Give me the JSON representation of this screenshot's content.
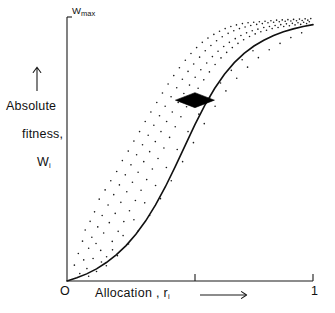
{
  "figure": {
    "background": "#ffffff",
    "ink_color": "#1a1a1a",
    "curve_color": "#111111",
    "marker_color": "#000000"
  },
  "axes": {
    "y_top_label_base": "W",
    "y_top_label_sub": "max",
    "y_axis_title_line1": "Absolute",
    "y_axis_title_line2": "fitness,",
    "y_axis_title_line3_base": "W",
    "y_axis_title_line3_sub": "i",
    "y_axis_arrow": "up-arrow",
    "x_origin_label": "O",
    "x_max_label": "1",
    "x_axis_title": "Allocation ,",
    "x_axis_title_var_base": "r",
    "x_axis_title_var_sub": "i",
    "x_axis_arrow": "right-arrow"
  },
  "chart_data": {
    "type": "scatter",
    "title": "",
    "xlabel": "Allocation, r_i",
    "ylabel": "Absolute fitness, W_i",
    "xlim": [
      0,
      1
    ],
    "ylim": [
      0,
      1
    ],
    "xticks": [
      0,
      0.52,
      1
    ],
    "xticklabels": [
      "O",
      "",
      "1"
    ],
    "yticks": [
      1
    ],
    "yticklabels": [
      "Wmax"
    ],
    "grid": false,
    "legend": null,
    "annotations": [
      {
        "name": "optimum-marker",
        "shape": "filled-diamond",
        "x": 0.52,
        "y": 0.685,
        "width_px": 39,
        "height_px": 15
      }
    ],
    "series": [
      {
        "name": "sigmoid-fitness-curve",
        "type": "line",
        "color": "#111111",
        "linewidth": 1.6,
        "x": [
          0.0,
          0.04,
          0.08,
          0.12,
          0.16,
          0.2,
          0.24,
          0.28,
          0.32,
          0.36,
          0.4,
          0.44,
          0.48,
          0.52,
          0.56,
          0.6,
          0.64,
          0.68,
          0.72,
          0.76,
          0.8,
          0.84,
          0.88,
          0.92,
          0.96,
          1.0
        ],
        "y": [
          0.0,
          0.012,
          0.027,
          0.046,
          0.07,
          0.099,
          0.134,
          0.177,
          0.228,
          0.288,
          0.357,
          0.433,
          0.513,
          0.592,
          0.665,
          0.729,
          0.783,
          0.827,
          0.862,
          0.89,
          0.912,
          0.93,
          0.944,
          0.955,
          0.964,
          0.971
        ]
      },
      {
        "name": "scatter-observations",
        "type": "scatter",
        "color": "#1a1a1a",
        "marker": "point",
        "markersize_px": 1.6,
        "n_points": 196,
        "points": [
          [
            0.03,
            0.06
          ],
          [
            0.046,
            0.104
          ],
          [
            0.052,
            0.028
          ],
          [
            0.063,
            0.151
          ],
          [
            0.068,
            0.08
          ],
          [
            0.074,
            0.193
          ],
          [
            0.081,
            0.047
          ],
          [
            0.088,
            0.124
          ],
          [
            0.094,
            0.226
          ],
          [
            0.101,
            0.166
          ],
          [
            0.106,
            0.085
          ],
          [
            0.112,
            0.262
          ],
          [
            0.118,
            0.142
          ],
          [
            0.125,
            0.205
          ],
          [
            0.131,
            0.31
          ],
          [
            0.137,
            0.116
          ],
          [
            0.143,
            0.248
          ],
          [
            0.149,
            0.182
          ],
          [
            0.155,
            0.345
          ],
          [
            0.161,
            0.092
          ],
          [
            0.167,
            0.288
          ],
          [
            0.172,
            0.221
          ],
          [
            0.178,
            0.38
          ],
          [
            0.184,
            0.15
          ],
          [
            0.19,
            0.327
          ],
          [
            0.196,
            0.256
          ],
          [
            0.202,
            0.415
          ],
          [
            0.208,
            0.188
          ],
          [
            0.213,
            0.364
          ],
          [
            0.219,
            0.298
          ],
          [
            0.225,
            0.456
          ],
          [
            0.231,
            0.225
          ],
          [
            0.237,
            0.402
          ],
          [
            0.243,
            0.338
          ],
          [
            0.249,
            0.492
          ],
          [
            0.254,
            0.266
          ],
          [
            0.26,
            0.44
          ],
          [
            0.266,
            0.374
          ],
          [
            0.272,
            0.53
          ],
          [
            0.278,
            0.305
          ],
          [
            0.283,
            0.478
          ],
          [
            0.289,
            0.412
          ],
          [
            0.295,
            0.566
          ],
          [
            0.301,
            0.344
          ],
          [
            0.307,
            0.516
          ],
          [
            0.312,
            0.452
          ],
          [
            0.318,
            0.604
          ],
          [
            0.324,
            0.384
          ],
          [
            0.33,
            0.552
          ],
          [
            0.336,
            0.49
          ],
          [
            0.341,
            0.64
          ],
          [
            0.347,
            0.424
          ],
          [
            0.353,
            0.59
          ],
          [
            0.359,
            0.528
          ],
          [
            0.365,
            0.676
          ],
          [
            0.37,
            0.464
          ],
          [
            0.376,
            0.626
          ],
          [
            0.382,
            0.566
          ],
          [
            0.388,
            0.712
          ],
          [
            0.394,
            0.504
          ],
          [
            0.399,
            0.662
          ],
          [
            0.405,
            0.604
          ],
          [
            0.411,
            0.746
          ],
          [
            0.417,
            0.544
          ],
          [
            0.423,
            0.698
          ],
          [
            0.428,
            0.64
          ],
          [
            0.434,
            0.778
          ],
          [
            0.44,
            0.584
          ],
          [
            0.446,
            0.732
          ],
          [
            0.452,
            0.676
          ],
          [
            0.457,
            0.808
          ],
          [
            0.463,
            0.622
          ],
          [
            0.469,
            0.764
          ],
          [
            0.475,
            0.71
          ],
          [
            0.481,
            0.836
          ],
          [
            0.486,
            0.66
          ],
          [
            0.492,
            0.794
          ],
          [
            0.498,
            0.742
          ],
          [
            0.504,
            0.862
          ],
          [
            0.51,
            0.696
          ],
          [
            0.515,
            0.822
          ],
          [
            0.521,
            0.772
          ],
          [
            0.527,
            0.884
          ],
          [
            0.533,
            0.73
          ],
          [
            0.539,
            0.848
          ],
          [
            0.544,
            0.8
          ],
          [
            0.55,
            0.904
          ],
          [
            0.556,
            0.762
          ],
          [
            0.562,
            0.872
          ],
          [
            0.568,
            0.826
          ],
          [
            0.573,
            0.92
          ],
          [
            0.579,
            0.792
          ],
          [
            0.585,
            0.892
          ],
          [
            0.591,
            0.85
          ],
          [
            0.597,
            0.934
          ],
          [
            0.602,
            0.82
          ],
          [
            0.608,
            0.91
          ],
          [
            0.614,
            0.87
          ],
          [
            0.62,
            0.946
          ],
          [
            0.626,
            0.845
          ],
          [
            0.631,
            0.925
          ],
          [
            0.637,
            0.888
          ],
          [
            0.643,
            0.956
          ],
          [
            0.649,
            0.866
          ],
          [
            0.655,
            0.938
          ],
          [
            0.66,
            0.904
          ],
          [
            0.666,
            0.964
          ],
          [
            0.672,
            0.884
          ],
          [
            0.678,
            0.948
          ],
          [
            0.684,
            0.918
          ],
          [
            0.689,
            0.97
          ],
          [
            0.695,
            0.9
          ],
          [
            0.701,
            0.956
          ],
          [
            0.707,
            0.93
          ],
          [
            0.713,
            0.975
          ],
          [
            0.718,
            0.914
          ],
          [
            0.724,
            0.962
          ],
          [
            0.73,
            0.94
          ],
          [
            0.736,
            0.978
          ],
          [
            0.742,
            0.926
          ],
          [
            0.747,
            0.968
          ],
          [
            0.753,
            0.948
          ],
          [
            0.759,
            0.98
          ],
          [
            0.765,
            0.936
          ],
          [
            0.771,
            0.972
          ],
          [
            0.776,
            0.954
          ],
          [
            0.782,
            0.982
          ],
          [
            0.788,
            0.944
          ],
          [
            0.794,
            0.975
          ],
          [
            0.8,
            0.96
          ],
          [
            0.805,
            0.984
          ],
          [
            0.811,
            0.95
          ],
          [
            0.817,
            0.978
          ],
          [
            0.823,
            0.964
          ],
          [
            0.829,
            0.986
          ],
          [
            0.834,
            0.956
          ],
          [
            0.84,
            0.98
          ],
          [
            0.846,
            0.968
          ],
          [
            0.852,
            0.988
          ],
          [
            0.858,
            0.96
          ],
          [
            0.863,
            0.982
          ],
          [
            0.869,
            0.971
          ],
          [
            0.875,
            0.989
          ],
          [
            0.881,
            0.964
          ],
          [
            0.887,
            0.984
          ],
          [
            0.892,
            0.974
          ],
          [
            0.898,
            0.99
          ],
          [
            0.904,
            0.967
          ],
          [
            0.91,
            0.985
          ],
          [
            0.916,
            0.976
          ],
          [
            0.921,
            0.991
          ],
          [
            0.927,
            0.97
          ],
          [
            0.933,
            0.986
          ],
          [
            0.939,
            0.978
          ],
          [
            0.945,
            0.992
          ],
          [
            0.95,
            0.972
          ],
          [
            0.956,
            0.987
          ],
          [
            0.962,
            0.98
          ],
          [
            0.968,
            0.993
          ],
          [
            0.974,
            0.975
          ],
          [
            0.979,
            0.988
          ],
          [
            0.985,
            0.982
          ],
          [
            0.991,
            0.994
          ],
          [
            0.12,
            0.036
          ],
          [
            0.16,
            0.058
          ],
          [
            0.205,
            0.096
          ],
          [
            0.25,
            0.14
          ],
          [
            0.29,
            0.19
          ],
          [
            0.336,
            0.248
          ],
          [
            0.38,
            0.312
          ],
          [
            0.424,
            0.38
          ],
          [
            0.47,
            0.452
          ],
          [
            0.514,
            0.524
          ],
          [
            0.558,
            0.596
          ],
          [
            0.602,
            0.662
          ],
          [
            0.646,
            0.72
          ],
          [
            0.69,
            0.768
          ],
          [
            0.734,
            0.81
          ],
          [
            0.778,
            0.846
          ],
          [
            0.822,
            0.876
          ],
          [
            0.866,
            0.9
          ],
          [
            0.91,
            0.922
          ],
          [
            0.954,
            0.94
          ],
          [
            0.088,
            0.018
          ],
          [
            0.14,
            0.072
          ],
          [
            0.185,
            0.118
          ],
          [
            0.228,
            0.172
          ],
          [
            0.272,
            0.232
          ],
          [
            0.316,
            0.296
          ],
          [
            0.36,
            0.362
          ],
          [
            0.404,
            0.43
          ],
          [
            0.448,
            0.498
          ],
          [
            0.492,
            0.566
          ],
          [
            0.536,
            0.632
          ],
          [
            0.58,
            0.694
          ],
          [
            0.624,
            0.75
          ],
          [
            0.668,
            0.798
          ],
          [
            0.712,
            0.838
          ],
          [
            0.756,
            0.872
          ]
        ]
      }
    ]
  }
}
